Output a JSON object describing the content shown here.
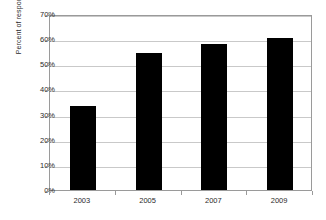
{
  "chart_data": {
    "type": "bar",
    "title": "",
    "subtitle": "",
    "xlabel": "",
    "ylabel": "Percent of respondents",
    "categories": [
      "2003",
      "2005",
      "2007",
      "2009"
    ],
    "values": [
      33.5,
      54.5,
      58.0,
      60.5
    ],
    "series": [
      {
        "name": "Percent of respondents",
        "values": [
          33.5,
          54.5,
          58.0,
          60.5
        ]
      }
    ],
    "ylim": [
      0,
      70
    ],
    "ytick_values": [
      0,
      10,
      20,
      30,
      40,
      50,
      60,
      70
    ],
    "ytick_labels": [
      "0%",
      "10%",
      "20%",
      "30%",
      "40%",
      "50%",
      "60%",
      "70%"
    ],
    "xtick_labels": [
      "2003",
      "2005",
      "2007",
      "2009"
    ],
    "grid": "horizontal",
    "legend": "none",
    "annotations": [],
    "colors": {
      "bar": "#000000",
      "background": "#ffffff",
      "gridline": "#c9c9c9",
      "axis": "#9a9a9a",
      "text": "#2b2b2b"
    }
  }
}
